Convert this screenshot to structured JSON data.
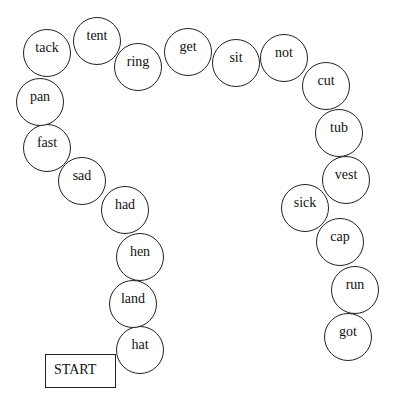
{
  "board": {
    "start_label": "START",
    "spaces": [
      {
        "word": "hat",
        "x": 140,
        "y": 350
      },
      {
        "word": "land",
        "x": 133,
        "y": 304
      },
      {
        "word": "hen",
        "x": 140,
        "y": 257
      },
      {
        "word": "had",
        "x": 125,
        "y": 210
      },
      {
        "word": "sad",
        "x": 82,
        "y": 181
      },
      {
        "word": "fast",
        "x": 47,
        "y": 148
      },
      {
        "word": "pan",
        "x": 40,
        "y": 102
      },
      {
        "word": "tack",
        "x": 47,
        "y": 53
      },
      {
        "word": "tent",
        "x": 97,
        "y": 41
      },
      {
        "word": "ring",
        "x": 138,
        "y": 67
      },
      {
        "word": "get",
        "x": 188,
        "y": 52
      },
      {
        "word": "sit",
        "x": 236,
        "y": 63
      },
      {
        "word": "not",
        "x": 284,
        "y": 58
      },
      {
        "word": "cut",
        "x": 326,
        "y": 86
      },
      {
        "word": "tub",
        "x": 339,
        "y": 133
      },
      {
        "word": "vest",
        "x": 346,
        "y": 180
      },
      {
        "word": "sick",
        "x": 305,
        "y": 208
      },
      {
        "word": "cap",
        "x": 340,
        "y": 242
      },
      {
        "word": "run",
        "x": 355,
        "y": 290
      },
      {
        "word": "got",
        "x": 348,
        "y": 337
      }
    ]
  }
}
